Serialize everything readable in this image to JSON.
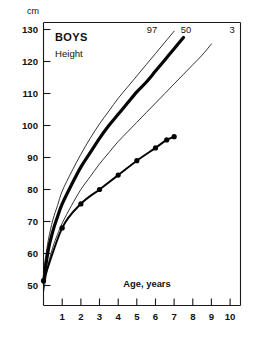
{
  "chart_data": {
    "type": "line",
    "title": "BOYS",
    "subtitle": "Height",
    "xlabel": "Age, years",
    "ylabel": "cm",
    "y_unit": "cm",
    "xlim": [
      0,
      10.6
    ],
    "ylim": [
      47,
      132
    ],
    "grid": false,
    "legend_position": "inline-at-curve-ends",
    "x_ticks": [
      1,
      2,
      3,
      4,
      5,
      6,
      7,
      8,
      9,
      10
    ],
    "x_tick_labels": [
      "1",
      "2",
      "3",
      "4",
      "5",
      "6",
      "7",
      "8",
      "9",
      "10"
    ],
    "y_ticks": [
      50,
      60,
      70,
      80,
      90,
      100,
      110,
      120,
      130
    ],
    "y_tick_labels": [
      "50",
      "60",
      "70",
      "80",
      "90",
      "100",
      "110",
      "120",
      "130"
    ],
    "series": [
      {
        "name": "97",
        "label": "97",
        "style": "thin",
        "label_x": 6.05,
        "label_y": 127.5,
        "x": [
          0,
          0.25,
          0.5,
          0.75,
          1,
          1.5,
          2,
          2.5,
          3,
          3.5,
          4,
          4.5,
          5,
          5.5,
          6,
          6.5,
          7
        ],
        "y": [
          54.5,
          64.0,
          70.5,
          75.0,
          79.5,
          85.5,
          91.0,
          96.0,
          100.5,
          104.5,
          108.5,
          112.0,
          115.5,
          119.0,
          122.5,
          126.0,
          129.5
        ]
      },
      {
        "name": "50",
        "label": "50",
        "style": "thick",
        "label_x": 7.35,
        "label_y": 127.5,
        "x": [
          0,
          0.25,
          0.5,
          0.75,
          1,
          1.5,
          2,
          2.5,
          3,
          3.5,
          4,
          4.5,
          5,
          5.5,
          6,
          6.5,
          7,
          7.5
        ],
        "y": [
          51.0,
          61.0,
          67.0,
          71.5,
          75.5,
          81.5,
          87.0,
          91.5,
          96.0,
          100.0,
          103.5,
          107.0,
          110.5,
          113.5,
          117.0,
          120.5,
          124.0,
          127.5
        ]
      },
      {
        "name": "3",
        "label": "3",
        "style": "thin",
        "label_x": 9.25,
        "label_y": 127.5,
        "x": [
          0,
          0.25,
          0.5,
          0.75,
          1,
          1.5,
          2,
          2.5,
          3,
          3.5,
          4,
          4.5,
          5,
          5.5,
          6,
          6.5,
          7,
          7.5,
          8,
          8.5,
          9
        ],
        "y": [
          48.0,
          56.5,
          62.0,
          66.0,
          69.5,
          75.0,
          80.0,
          84.0,
          88.0,
          91.5,
          95.0,
          98.0,
          101.0,
          104.0,
          107.0,
          110.0,
          113.0,
          116.0,
          119.0,
          122.0,
          125.5
        ]
      },
      {
        "name": "patient",
        "label": "",
        "style": "patient-with-markers",
        "markers": true,
        "x": [
          0,
          1,
          2,
          3,
          4,
          5,
          6,
          6.6,
          7
        ],
        "y": [
          51.5,
          68.0,
          75.5,
          80.0,
          84.5,
          89.0,
          93.0,
          95.5,
          96.5
        ]
      }
    ]
  },
  "labels": {
    "unit": "cm",
    "title": "BOYS",
    "subtitle": "Height",
    "x_axis_title": "Age, years",
    "pct_97": "97",
    "pct_50": "50",
    "pct_3": "3"
  },
  "colors": {
    "ink": "#111111",
    "background": "#ffffff"
  }
}
